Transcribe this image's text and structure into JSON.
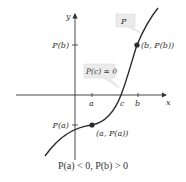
{
  "axes": {
    "x_label": "x",
    "y_label": "y"
  },
  "ticks": {
    "a": "a",
    "c": "c",
    "b": "b",
    "p_a": "P(a)",
    "p_b": "P(b)"
  },
  "points": {
    "point_a": "(a, P(a))",
    "point_b": "(b, P(b))"
  },
  "callouts": {
    "curve_name": "P",
    "root": "P(c) = 0"
  },
  "caption": "P(a) < 0, P(b) > 0",
  "colors": {
    "curve": "#2a2a2a",
    "axis": "#333333",
    "callout_bg": "#ebebeb"
  }
}
